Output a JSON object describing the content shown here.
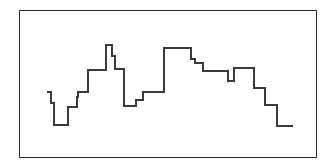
{
  "figure": {
    "title": "",
    "frame": {
      "x": 19,
      "y": 10,
      "width": 298,
      "height": 148,
      "border_color": "#2e2e2e",
      "background_color": "#ffffff"
    },
    "line_color": "#3a3a3a",
    "line_width": 1.1
  },
  "chart_data": {
    "type": "line",
    "subtype": "step",
    "step_mode": "post",
    "title": "",
    "subtitle": "",
    "xlabel": "",
    "ylabel": "",
    "grid": false,
    "legend": null,
    "axis_ticks": [],
    "tick_labels": [],
    "annotations": [],
    "xlim": [
      47,
      293
    ],
    "ylim": [
      45,
      126
    ],
    "y_axis_inverted_in_pixels": true,
    "x": [
      47,
      51,
      54,
      68,
      77,
      78,
      88,
      106,
      112,
      115,
      124,
      136,
      143,
      164,
      191,
      195,
      203,
      228,
      234,
      254,
      265,
      277,
      293
    ],
    "y_pixel": [
      92,
      103,
      125,
      107,
      97,
      92,
      70,
      45,
      56,
      69,
      106,
      100,
      92,
      48,
      59,
      63,
      71,
      81,
      68,
      88,
      105,
      126,
      126
    ],
    "values": [
      34,
      23,
      1,
      19,
      29,
      34,
      56,
      81,
      70,
      57,
      20,
      26,
      34,
      78,
      67,
      63,
      55,
      45,
      58,
      38,
      21,
      0,
      0
    ],
    "points": [
      {
        "x": 47,
        "y": 34,
        "y_pixel": 92
      },
      {
        "x": 51,
        "y": 23,
        "y_pixel": 103
      },
      {
        "x": 54,
        "y": 1,
        "y_pixel": 125
      },
      {
        "x": 68,
        "y": 19,
        "y_pixel": 107
      },
      {
        "x": 77,
        "y": 29,
        "y_pixel": 97
      },
      {
        "x": 78,
        "y": 34,
        "y_pixel": 92
      },
      {
        "x": 88,
        "y": 56,
        "y_pixel": 70
      },
      {
        "x": 106,
        "y": 81,
        "y_pixel": 45
      },
      {
        "x": 112,
        "y": 70,
        "y_pixel": 56
      },
      {
        "x": 115,
        "y": 57,
        "y_pixel": 69
      },
      {
        "x": 124,
        "y": 20,
        "y_pixel": 106
      },
      {
        "x": 136,
        "y": 26,
        "y_pixel": 100
      },
      {
        "x": 143,
        "y": 34,
        "y_pixel": 92
      },
      {
        "x": 164,
        "y": 78,
        "y_pixel": 48
      },
      {
        "x": 191,
        "y": 67,
        "y_pixel": 59
      },
      {
        "x": 195,
        "y": 63,
        "y_pixel": 63
      },
      {
        "x": 203,
        "y": 55,
        "y_pixel": 71
      },
      {
        "x": 228,
        "y": 45,
        "y_pixel": 81
      },
      {
        "x": 234,
        "y": 58,
        "y_pixel": 68
      },
      {
        "x": 254,
        "y": 38,
        "y_pixel": 88
      },
      {
        "x": 265,
        "y": 21,
        "y_pixel": 105
      },
      {
        "x": 277,
        "y": 0,
        "y_pixel": 126
      },
      {
        "x": 293,
        "y": 0,
        "y_pixel": 126
      }
    ],
    "path_d": "M47,92 L51,92 L51,103 L54,103 L54,125 L68,125 L68,107 L77,107 L77,97 L78,97 L78,92 L88,92 L88,70 L106,70 L106,45 L112,45 L112,56 L115,56 L115,69 L124,69 L124,106 L136,106 L136,100 L143,100 L143,92 L164,92 L164,48 L191,48 L191,59 L195,59 L195,63 L203,63 L203,71 L228,71 L228,81 L234,81 L234,68 L254,68 L254,88 L265,88 L265,105 L277,105 L277,126 L293,126"
  }
}
